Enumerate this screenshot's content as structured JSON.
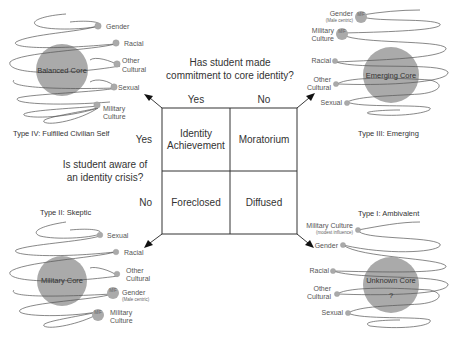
{
  "center": {
    "question_top": [
      "Has student made",
      "commitment to core identity?"
    ],
    "question_left": [
      "Is student aware of",
      "an identity crisis?"
    ],
    "col_headers": [
      "Yes",
      "No"
    ],
    "row_headers": [
      "Yes",
      "No"
    ],
    "cells": {
      "top_left": [
        "Identity",
        "Achievement"
      ],
      "top_right": [
        "Moratorium"
      ],
      "bottom_left": [
        "Foreclosed"
      ],
      "bottom_right": [
        "Diffused"
      ]
    }
  },
  "quadrants": {
    "type4": {
      "title": "Type IV: Fulfilled Civilian Self",
      "core": "Balanced Core",
      "labels": [
        "Gender",
        "Racial",
        "Other",
        "Cultural",
        "Sexual",
        "Military",
        "Culture"
      ]
    },
    "type3": {
      "title": "Type III: Emerging",
      "core": "Emerging Core",
      "labels": [
        "Gender",
        "(Male centric)",
        "Military",
        "Culture",
        "Racial",
        "Other",
        "Cultural",
        "Sexual"
      ],
      "badge": "M/F"
    },
    "type2": {
      "title": "Type II: Skeptic",
      "core": "Military Core",
      "labels": [
        "Sexual",
        "Racial",
        "Other",
        "Cultural",
        "Gender",
        "(Male centric)",
        "Military",
        "Culture"
      ],
      "badge": "M/F"
    },
    "type1": {
      "title": "Type I: Ambivalent",
      "core": "Unknown Core",
      "core_mark": "?",
      "labels": [
        "Military Culture",
        "(modest influence)",
        "Gender",
        "Racial",
        "Other",
        "Cultural",
        "Sexual"
      ]
    }
  }
}
